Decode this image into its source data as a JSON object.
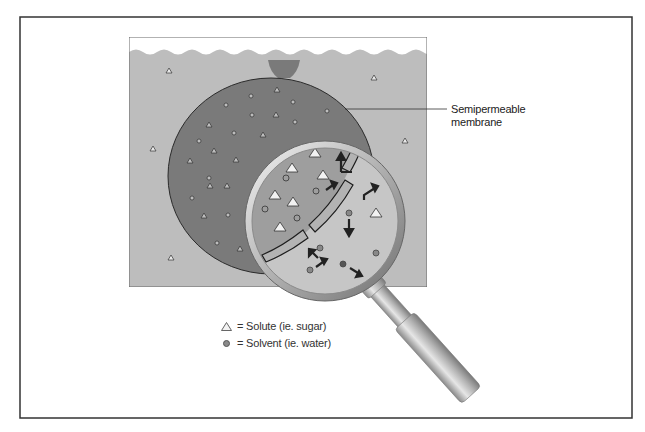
{
  "figure": {
    "colors": {
      "frame": "#333333",
      "water": "#bdbdbd",
      "balloon": "#7a7a7a",
      "balloon_outline": "#2a2a2a",
      "lens_inside": "#9e9e9e",
      "lens_outside": "#c6c6c6",
      "membrane_band": "#b3b3b3",
      "arrow": "#222222",
      "solute_fill": "#f2f2f2",
      "solvent_fill": "#888888"
    }
  },
  "annotations": {
    "membrane_label_line1": "Semipermeable",
    "membrane_label_line2": "membrane"
  },
  "legend": {
    "items": [
      {
        "symbol": "triangle-icon",
        "label": "= Solute (ie. sugar)"
      },
      {
        "symbol": "circle-icon",
        "label": "= Solvent (ie. water)"
      }
    ]
  }
}
